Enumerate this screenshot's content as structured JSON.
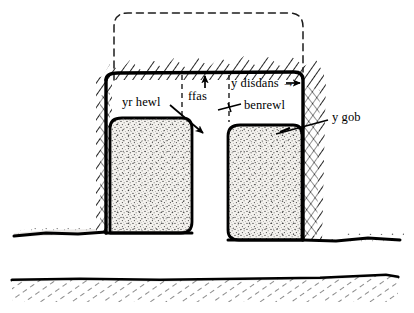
{
  "figure": {
    "kind": "cross-section-diagram",
    "language": "Welsh",
    "style": "hand-drawn ink line drawing, stippled fill, hatched ground"
  },
  "colors": {
    "ink": "#000000",
    "paper": "#ffffff",
    "stipple": "#f2f0ec",
    "hatch": "#2b2b2b"
  },
  "labels": [
    {
      "id": "yr-hewl",
      "text": "yr hewl",
      "x": 122,
      "y": 96,
      "leader": "arrow-down-right"
    },
    {
      "id": "ffas",
      "text": "ffas",
      "x": 188,
      "y": 90,
      "leader": "arrow-up"
    },
    {
      "id": "y-disdans",
      "text": "y disdans →",
      "x": 231,
      "y": 78,
      "leader": "arrow-right"
    },
    {
      "id": "benrewl",
      "text": "benrewl",
      "x": 244,
      "y": 100,
      "leader": "tick-left"
    },
    {
      "id": "y-gob",
      "text": "y gob",
      "x": 332,
      "y": 117,
      "leader": "line-down-left"
    }
  ],
  "geometry": {
    "dashed_outline": {
      "name": "original-ground-profile",
      "left": 114,
      "right": 303,
      "top": 13,
      "corner_radius": 14
    },
    "trench_top_line_y": 73,
    "left_block": {
      "left": 110,
      "right": 192,
      "top": 118,
      "bottom": 233
    },
    "right_block": {
      "left": 228,
      "right": 302,
      "top": 125,
      "bottom": 240
    },
    "left_ground_y": 232,
    "right_ground_y": 240,
    "lower_ground_y": 278,
    "vertical_dashed_lines_x": [
      182,
      229
    ]
  }
}
